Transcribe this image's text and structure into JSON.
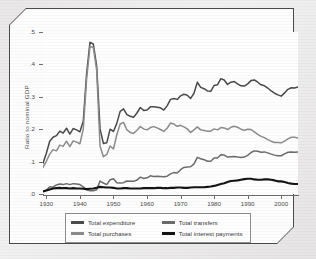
{
  "figure": {
    "ylabel": "Ratio to nominal GDP"
  },
  "chart_data": {
    "type": "line",
    "title": "",
    "xlabel": "",
    "ylabel": "Ratio to nominal GDP",
    "xlim": [
      1929,
      2005
    ],
    "ylim": [
      0.0,
      0.5
    ],
    "grid": false,
    "legend_position": "bottom",
    "xticks": [
      1930,
      1940,
      1950,
      1960,
      1970,
      1980,
      1990,
      2000
    ],
    "xtick_labels": [
      "1930",
      "1940",
      "1950",
      "1960",
      "1970",
      "1980",
      "1990",
      "2000"
    ],
    "yticks": [
      0.0,
      0.1,
      0.2,
      0.3,
      0.4,
      0.5
    ],
    "ytick_labels": [
      ".0",
      ".1",
      ".2",
      ".3",
      ".4",
      ".5"
    ],
    "x": [
      1929,
      1930,
      1931,
      1932,
      1933,
      1934,
      1935,
      1936,
      1937,
      1938,
      1939,
      1940,
      1941,
      1942,
      1943,
      1944,
      1945,
      1946,
      1947,
      1948,
      1949,
      1950,
      1951,
      1952,
      1953,
      1954,
      1955,
      1956,
      1957,
      1958,
      1959,
      1960,
      1961,
      1962,
      1963,
      1964,
      1965,
      1966,
      1967,
      1968,
      1969,
      1970,
      1971,
      1972,
      1973,
      1974,
      1975,
      1976,
      1977,
      1978,
      1979,
      1980,
      1981,
      1982,
      1983,
      1984,
      1985,
      1986,
      1987,
      1988,
      1989,
      1990,
      1991,
      1992,
      1993,
      1994,
      1995,
      1996,
      1997,
      1998,
      1999,
      2000,
      2001,
      2002,
      2003,
      2004,
      2005
    ],
    "series": [
      {
        "name": "Total expenditure",
        "color": "#4a4a4a",
        "values": [
          0.095,
          0.126,
          0.163,
          0.175,
          0.18,
          0.194,
          0.188,
          0.203,
          0.185,
          0.202,
          0.198,
          0.192,
          0.225,
          0.372,
          0.468,
          0.463,
          0.395,
          0.201,
          0.156,
          0.158,
          0.2,
          0.193,
          0.218,
          0.255,
          0.263,
          0.245,
          0.24,
          0.237,
          0.25,
          0.267,
          0.258,
          0.259,
          0.269,
          0.269,
          0.268,
          0.266,
          0.259,
          0.272,
          0.292,
          0.295,
          0.292,
          0.303,
          0.308,
          0.305,
          0.295,
          0.311,
          0.345,
          0.329,
          0.325,
          0.318,
          0.317,
          0.335,
          0.337,
          0.356,
          0.352,
          0.338,
          0.345,
          0.347,
          0.34,
          0.334,
          0.333,
          0.34,
          0.35,
          0.352,
          0.345,
          0.337,
          0.334,
          0.327,
          0.318,
          0.311,
          0.306,
          0.302,
          0.312,
          0.323,
          0.328,
          0.327,
          0.33
        ]
      },
      {
        "name": "Total purchases",
        "color": "#8c8c8c",
        "values": [
          0.082,
          0.101,
          0.123,
          0.137,
          0.133,
          0.151,
          0.147,
          0.163,
          0.146,
          0.164,
          0.16,
          0.155,
          0.2,
          0.355,
          0.455,
          0.452,
          0.382,
          0.148,
          0.115,
          0.122,
          0.148,
          0.139,
          0.183,
          0.216,
          0.221,
          0.198,
          0.19,
          0.187,
          0.197,
          0.208,
          0.201,
          0.198,
          0.205,
          0.208,
          0.204,
          0.199,
          0.193,
          0.203,
          0.219,
          0.216,
          0.209,
          0.212,
          0.207,
          0.201,
          0.19,
          0.198,
          0.207,
          0.198,
          0.196,
          0.194,
          0.194,
          0.201,
          0.198,
          0.205,
          0.204,
          0.199,
          0.206,
          0.209,
          0.206,
          0.2,
          0.197,
          0.2,
          0.199,
          0.192,
          0.184,
          0.178,
          0.174,
          0.168,
          0.163,
          0.159,
          0.159,
          0.158,
          0.163,
          0.17,
          0.175,
          0.175,
          0.173
        ]
      },
      {
        "name": "Total transfers",
        "color": "#6b6b6b",
        "values": [
          0.009,
          0.012,
          0.022,
          0.021,
          0.028,
          0.031,
          0.029,
          0.032,
          0.029,
          0.032,
          0.031,
          0.029,
          0.022,
          0.013,
          0.01,
          0.01,
          0.013,
          0.04,
          0.034,
          0.029,
          0.044,
          0.047,
          0.035,
          0.034,
          0.035,
          0.04,
          0.039,
          0.039,
          0.043,
          0.052,
          0.048,
          0.05,
          0.056,
          0.054,
          0.055,
          0.054,
          0.053,
          0.055,
          0.062,
          0.066,
          0.065,
          0.075,
          0.082,
          0.083,
          0.084,
          0.093,
          0.113,
          0.109,
          0.106,
          0.101,
          0.101,
          0.111,
          0.111,
          0.121,
          0.12,
          0.114,
          0.115,
          0.116,
          0.114,
          0.113,
          0.114,
          0.119,
          0.128,
          0.133,
          0.132,
          0.129,
          0.13,
          0.127,
          0.123,
          0.12,
          0.118,
          0.118,
          0.124,
          0.129,
          0.13,
          0.129,
          0.13
        ]
      },
      {
        "name": "Total interest payments",
        "color": "#141414",
        "values": [
          0.008,
          0.011,
          0.014,
          0.017,
          0.018,
          0.019,
          0.018,
          0.018,
          0.017,
          0.018,
          0.017,
          0.017,
          0.016,
          0.015,
          0.016,
          0.017,
          0.019,
          0.022,
          0.021,
          0.02,
          0.02,
          0.019,
          0.017,
          0.017,
          0.018,
          0.018,
          0.017,
          0.017,
          0.017,
          0.017,
          0.018,
          0.018,
          0.018,
          0.018,
          0.019,
          0.019,
          0.018,
          0.018,
          0.019,
          0.019,
          0.02,
          0.02,
          0.019,
          0.019,
          0.02,
          0.021,
          0.021,
          0.021,
          0.021,
          0.022,
          0.023,
          0.025,
          0.028,
          0.031,
          0.033,
          0.037,
          0.04,
          0.041,
          0.042,
          0.044,
          0.046,
          0.047,
          0.047,
          0.045,
          0.044,
          0.044,
          0.045,
          0.045,
          0.044,
          0.042,
          0.039,
          0.039,
          0.037,
          0.034,
          0.032,
          0.031,
          0.031
        ]
      }
    ]
  },
  "legend": {
    "entries": [
      {
        "label": "Total expenditure",
        "color": "#4a4a4a"
      },
      {
        "label": "Total transfers",
        "color": "#6b6b6b"
      },
      {
        "label": "Total purchases",
        "color": "#8c8c8c"
      },
      {
        "label": "Total interest payments",
        "color": "#141414"
      }
    ]
  }
}
